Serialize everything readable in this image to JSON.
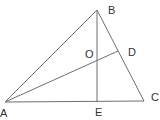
{
  "diagram": {
    "title": "",
    "points": {
      "A": {
        "label": "A",
        "x": 5,
        "y": 102
      },
      "B": {
        "label": "B",
        "x": 97,
        "y": 10
      },
      "C": {
        "label": "C",
        "x": 144,
        "y": 101
      },
      "D": {
        "label": "D",
        "x": 118,
        "y": 51
      },
      "E": {
        "label": "E",
        "x": 97,
        "y": 102
      },
      "O": {
        "label": "O",
        "x": 97,
        "y": 60
      }
    },
    "segments": [
      [
        "A",
        "B"
      ],
      [
        "B",
        "C"
      ],
      [
        "A",
        "C"
      ],
      [
        "B",
        "E"
      ],
      [
        "A",
        "D"
      ]
    ],
    "colors": {
      "line": "#6f6f6f",
      "label": "#333333",
      "background": "#ffffff"
    }
  }
}
